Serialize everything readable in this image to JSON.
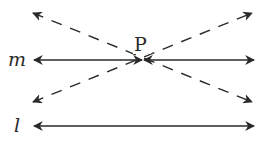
{
  "diagram": {
    "type": "geometry",
    "point": {
      "label": "P"
    },
    "lines": [
      {
        "label": "m",
        "style": "solid",
        "description": "horizontal line through P"
      },
      {
        "label": "l",
        "style": "solid",
        "description": "horizontal line below m, parallel"
      },
      {
        "label": "",
        "style": "dashed",
        "description": "line through P from upper-left to lower-right"
      },
      {
        "label": "",
        "style": "dashed",
        "description": "line through P from lower-left to upper-right"
      }
    ],
    "colors": {
      "stroke": "#2a2a2a",
      "background": "#ffffff"
    }
  }
}
